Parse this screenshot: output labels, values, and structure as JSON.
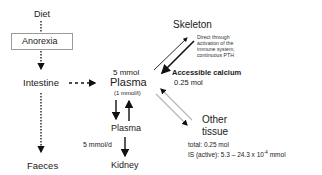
{
  "nodes": {
    "diet": "Diet",
    "anorexia": "Anorexia",
    "intestine": "Intestine",
    "faeces": "Faeces",
    "plasma_top_amount": "5 mmol",
    "plasma_top": "Plasma",
    "plasma_top_conc": "(1 mmol/l)",
    "plasma_bottom": "Plasma",
    "kidney": "Kidney",
    "kidney_flow": "5 mmol/d",
    "skeleton": "Skeleton",
    "skeleton_note": [
      "Direct through",
      "activation of the",
      "immune system,",
      "continuous PTH"
    ],
    "accessible_calcium": "Accessible calcium",
    "accessible_amount": "0.25 mol",
    "other_tissue_line1": "Other",
    "other_tissue_line2": "tissue",
    "other_total": "total: 0.25 mol",
    "other_is": "IS (active): 5.3 – 24.3 x 10",
    "other_is_exp": "-4",
    "other_is_unit": " mmol"
  },
  "colors": {
    "arrow_dark": "#111111",
    "arrow_light": "#b8b8b8",
    "box_border": "#9a9a9a"
  }
}
